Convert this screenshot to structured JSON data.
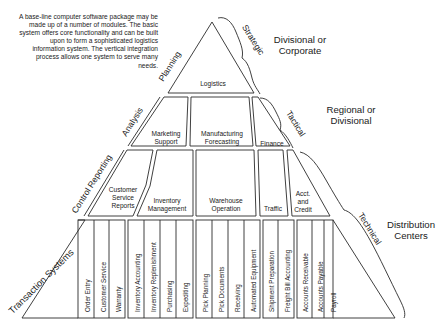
{
  "intro_text": "A base-line computer software package may be made up of a number of modules. The basic system offers core functionality and can be built upon to form a sophisticated logistics information system. The vertical integration process allows one system to serve many needs.",
  "left_axis": {
    "planning": "Planning",
    "analysis": "Analysis",
    "control_reporting": "Control Reporting",
    "transaction_systems": "Transaction Systems"
  },
  "right_braces": {
    "strategic": "Strategic",
    "tactical": "Tactical",
    "technical": "Technical"
  },
  "tiers": {
    "strategic_scope": "Divisional or Corporate",
    "tactical_scope": "Regional or Divisional",
    "technical_scope": "Distribution Centers"
  },
  "level1": {
    "logistics": "Logistics"
  },
  "level2": {
    "marketing_support": "Marketing Support",
    "manufacturing_forecasting": "Manufacturing Forecasting",
    "finance": "Finance"
  },
  "level3": {
    "customer_service_reports": "Customer Service Reports",
    "inventory_management": "Inventory Management",
    "warehouse_operation": "Warehouse Operation",
    "traffic": "Traffic",
    "acct_and_credit": "Acct. and Credit"
  },
  "level4": {
    "groups": [
      {
        "name": "customer",
        "modules": [
          "Order Entry",
          "Customer Service",
          "Warranty"
        ]
      },
      {
        "name": "inventory",
        "modules": [
          "Inventory Accounting",
          "Inventory Replenishment",
          "Purchasing",
          "Expediting"
        ]
      },
      {
        "name": "warehouse",
        "modules": [
          "Pick Planning",
          "Pick Documents",
          "Receiving",
          "Automated Equipment"
        ]
      },
      {
        "name": "traffic",
        "modules": [
          "Shipment Preparation",
          "Freight Bill Accounting"
        ]
      },
      {
        "name": "accounting",
        "modules": [
          "Accounts Receivable",
          "Accounts Payable",
          "Payroll"
        ]
      }
    ]
  },
  "colors": {
    "line": "#2a2a2a",
    "background": "#ffffff",
    "text": "#222222"
  }
}
